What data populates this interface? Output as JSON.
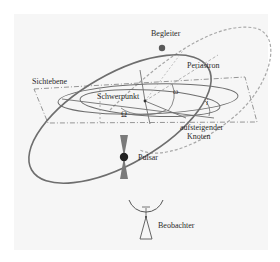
{
  "diagram": {
    "labels": {
      "companion": "Begleiter",
      "sky_plane": "Sichtebene",
      "periastron": "Periastron",
      "barycenter": "Schwerpunkt",
      "omega_arg": "ω",
      "Omega_node": "Ω",
      "inclination": "i",
      "ascending_node_1": "aufsteigender",
      "ascending_node_2": "Knoten",
      "pulsar": "Pulsar",
      "observer": "Beobachter"
    },
    "colors": {
      "orbit_line": "#6e6e6e",
      "dashed_line": "#8a8a8a",
      "companion_orbit": "#a8a8a8",
      "pulsar_dot": "#222222",
      "beam": "#7a7a7a",
      "companion_dot": "#5a5a5a",
      "text": "#2a2a2a",
      "background": "#f6f6f6"
    }
  }
}
